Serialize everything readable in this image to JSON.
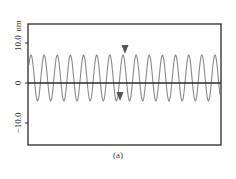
{
  "chart_data": {
    "type": "line",
    "title": "",
    "caption": "(a)",
    "xlabel": "",
    "ylabel": "nm",
    "ylim": [
      -15.5,
      15.0
    ],
    "yticks": [
      {
        "value": 10.0,
        "label": "10.0"
      },
      {
        "value": 0,
        "label": "0"
      },
      {
        "value": -10.0,
        "label": "-10.0"
      }
    ],
    "y_unit_label": "nm",
    "grid": false,
    "legend": null,
    "zero_line": true,
    "series": [
      {
        "name": "height profile",
        "color": "#8a8a8a",
        "waveform": "periodic",
        "cycles": 15,
        "peak_value": 7.0,
        "trough_value": -4.5,
        "peak_x_px": [
          31,
          49,
          61,
          74,
          86,
          100,
          112,
          125,
          138,
          151,
          163,
          176,
          189,
          202,
          215
        ]
      }
    ],
    "markers": [
      {
        "shape": "triangle-down",
        "position": "above-peak",
        "x_px": 125,
        "y_value": 9.0,
        "color": "#555555"
      },
      {
        "shape": "triangle-down",
        "position": "below-trough",
        "x_px": 120,
        "y_value": -3.5,
        "color": "#555555"
      }
    ]
  },
  "labels": {
    "caption": "(a)",
    "unit": "nm",
    "tick_top": "10.0",
    "tick_mid": "0",
    "tick_bottom": "−10.0"
  }
}
